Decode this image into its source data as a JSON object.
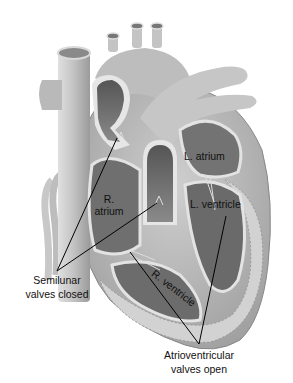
{
  "diagram": {
    "labels": {
      "l_atrium": "L. atrium",
      "r_atrium_line1": "R.",
      "r_atrium_line2": "atrium",
      "l_ventricle": "L. ventricle",
      "r_ventricle": "R. ventricle",
      "semilunar_line1": "Semilunar",
      "semilunar_line2": "valves closed",
      "atrioventricular_line1": "Atrioventricular",
      "atrioventricular_line2": "valves open"
    },
    "colors": {
      "background": "#ffffff",
      "outer_wall": "#b8b8b8",
      "chamber_dark": "#6e6e6e",
      "vessel": "#c9c9c9",
      "leader_line": "#000000",
      "text": "#111111"
    }
  }
}
